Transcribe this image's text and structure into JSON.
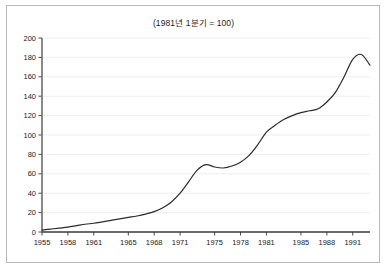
{
  "figure": {
    "title": "(1981년 1분기 = 100)",
    "background_color": "#ffffff",
    "border_color": "#b9b9b9"
  },
  "chart_data": {
    "type": "line",
    "title": "(1981년 1분기 = 100)",
    "subtitle": "",
    "xlabel": "",
    "ylabel": "",
    "xlim": [
      1955,
      1993
    ],
    "ylim": [
      0,
      200
    ],
    "grid": true,
    "grid_axis": "y",
    "legend": false,
    "legend_position": "none",
    "line_color": "#2b2b2b",
    "line_width": 1.2,
    "axis_color": "#555555",
    "y_ticks": [
      0,
      20,
      40,
      60,
      80,
      100,
      120,
      140,
      160,
      180,
      200
    ],
    "y_tick_labels": [
      "0",
      "20",
      "40",
      "60",
      "80",
      "100",
      "120",
      "140",
      "160",
      "180",
      "200"
    ],
    "x_ticks": [
      1955,
      1958,
      1961,
      1965,
      1968,
      1971,
      1975,
      1978,
      1981,
      1985,
      1988,
      1991
    ],
    "x_tick_labels": [
      "1955",
      "1958",
      "1961",
      "1965",
      "1968",
      "1971",
      "1975",
      "1978",
      "1981",
      "1985",
      "1988",
      "1991"
    ],
    "series": [
      {
        "name": "index",
        "x": [
          1955,
          1956,
          1957,
          1958,
          1959,
          1960,
          1961,
          1962,
          1963,
          1964,
          1965,
          1966,
          1967,
          1968,
          1969,
          1970,
          1971,
          1972,
          1973,
          1974,
          1975,
          1976,
          1977,
          1978,
          1979,
          1980,
          1981,
          1982,
          1983,
          1984,
          1985,
          1986,
          1987,
          1988,
          1989,
          1990,
          1991,
          1992,
          1993
        ],
        "values": [
          2,
          3,
          4,
          5,
          6.5,
          8,
          9,
          10.5,
          12,
          13.5,
          15,
          16.5,
          18.5,
          21,
          25,
          31,
          40,
          52,
          64,
          69.5,
          67,
          66,
          68,
          72,
          79,
          90,
          103,
          110,
          116,
          120,
          123,
          125,
          127,
          134,
          144,
          160,
          178,
          183,
          172
        ]
      }
    ],
    "annotations": []
  }
}
